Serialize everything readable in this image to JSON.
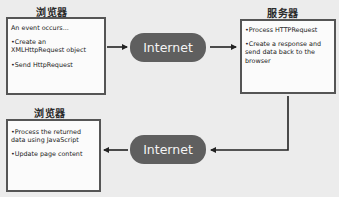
{
  "diagram": {
    "browser_top": {
      "label": "浏览器",
      "lines": [
        "An event occurs...",
        "•Create an",
        "XMLHttpRequest object",
        "•Send HttpRequest"
      ]
    },
    "internet_top": {
      "label": "Internet"
    },
    "server": {
      "label": "服务器",
      "lines": [
        "•Process HTTPRequest",
        "•Create a response and",
        "send data back to the",
        "browser"
      ]
    },
    "internet_bottom": {
      "label": "Internet"
    },
    "browser_bottom": {
      "label": "浏览器",
      "lines": [
        "•Process the returned",
        "data using JavaScript",
        "•Update page content"
      ]
    },
    "colors": {
      "pill": "#5f5f5f",
      "border": "#555555",
      "background": "#ececec",
      "arrow": "#222222"
    }
  }
}
